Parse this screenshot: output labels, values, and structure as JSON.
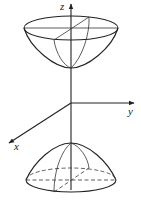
{
  "figure": {
    "axes": {
      "z_label": "z",
      "y_label": "y",
      "x_label": "x"
    },
    "surfaces": [
      {
        "name": "upper-sheet",
        "shape": "bowl opening upward"
      },
      {
        "name": "lower-sheet",
        "shape": "cap opening downward"
      }
    ]
  }
}
